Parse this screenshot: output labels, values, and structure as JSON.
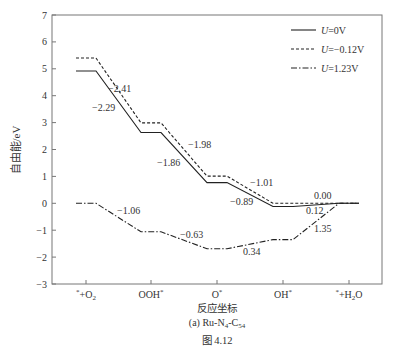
{
  "chart_data": {
    "type": "line",
    "title": "",
    "subtitle": "(a) Ru-N4-C54",
    "figure_caption": "图 4.12",
    "xlabel": "反应坐标",
    "ylabel": "自由能/eV",
    "ylim": [
      -3,
      7
    ],
    "yticks": [
      -3,
      -2,
      -1,
      0,
      1,
      2,
      3,
      4,
      5,
      6,
      7
    ],
    "categories": [
      "*+O2",
      "OOH*",
      "O*",
      "OH*",
      "*+H2O"
    ],
    "legend_position": "upper right",
    "grid": false,
    "series": [
      {
        "name": "U=0V",
        "style": "solid",
        "values": [
          4.92,
          2.63,
          0.77,
          -0.12,
          0.0
        ],
        "step_labels": [
          "-2.29",
          "-1.86",
          "-0.89",
          "0.12"
        ]
      },
      {
        "name": "U=-0.12V",
        "style": "dashed",
        "values": [
          5.4,
          2.99,
          1.01,
          0.0,
          0.0
        ],
        "step_labels": [
          "-2.41",
          "-1.98",
          "-1.01",
          "0.00"
        ]
      },
      {
        "name": "U=1.23V",
        "style": "dashdot",
        "values": [
          0.0,
          -1.06,
          -1.69,
          -1.35,
          0.0
        ],
        "step_labels": [
          "-1.06",
          "-0.63",
          "0.34",
          "1.35"
        ]
      }
    ]
  },
  "legend": [
    {
      "label_prefix": "U",
      "label_suffix": "=0V"
    },
    {
      "label_prefix": "U",
      "label_suffix": "=−0.12V"
    },
    {
      "label_prefix": "U",
      "label_suffix": "=1.23V"
    }
  ],
  "annotations": [
    {
      "text": "−2.41",
      "x": 108,
      "y": 92
    },
    {
      "text": "−2.29",
      "x": 92,
      "y": 111
    },
    {
      "text": "−1.98",
      "x": 188,
      "y": 148
    },
    {
      "text": "−1.86",
      "x": 157,
      "y": 166
    },
    {
      "text": "−1.01",
      "x": 250,
      "y": 186
    },
    {
      "text": "−0.89",
      "x": 230,
      "y": 205
    },
    {
      "text": "0.00",
      "x": 314,
      "y": 199
    },
    {
      "text": "0.12",
      "x": 306,
      "y": 214
    },
    {
      "text": "1.35",
      "x": 314,
      "y": 232
    },
    {
      "text": "−1.06",
      "x": 117,
      "y": 214
    },
    {
      "text": "−0.63",
      "x": 180,
      "y": 238
    },
    {
      "text": "0.34",
      "x": 243,
      "y": 255
    }
  ]
}
